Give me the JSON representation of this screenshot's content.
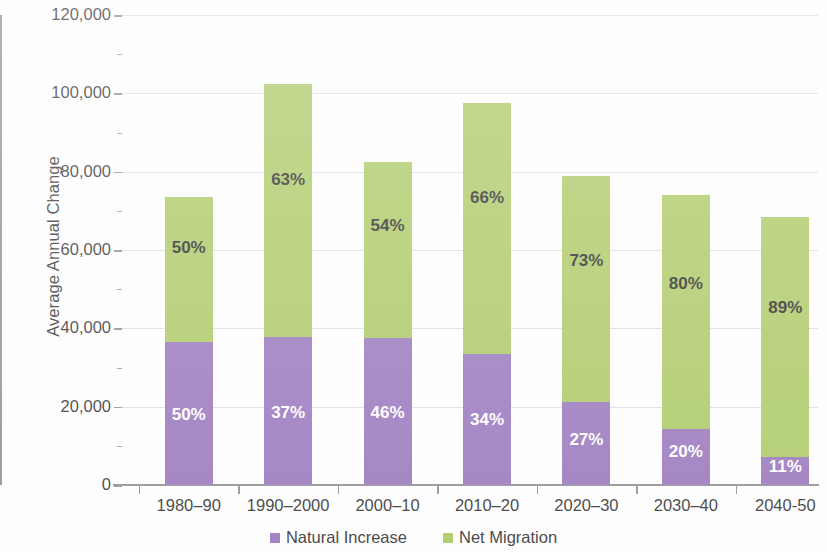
{
  "chart_data": {
    "type": "bar",
    "subtype": "stacked-bar",
    "title": "",
    "xlabel": "",
    "ylabel": "Average Annual Change",
    "ylim": [
      0,
      120000
    ],
    "ytick_values": [
      0,
      20000,
      40000,
      60000,
      80000,
      100000,
      120000
    ],
    "ytick_labels": [
      "0",
      "20,000",
      "40,000",
      "60,000",
      "80,000",
      "100,000",
      "120,000"
    ],
    "yminor_step": 10000,
    "grid": true,
    "grid_axis": "y",
    "legend_position": "bottom-center",
    "categories": [
      "1980–90",
      "1990–2000",
      "2000–10",
      "2010–20",
      "2020–30",
      "2030–40",
      "2040-50"
    ],
    "series": [
      {
        "name": "Natural Increase",
        "color": "#9470b9",
        "values": [
          36500,
          37700,
          37500,
          33500,
          21300,
          14200,
          7200
        ],
        "share_labels": [
          "50%",
          "37%",
          "46%",
          "34%",
          "27%",
          "20%",
          "11%"
        ],
        "label_color": "#ffffff"
      },
      {
        "name": "Net Migration",
        "color": "#a8c75c",
        "values": [
          37000,
          64800,
          45000,
          64000,
          57700,
          59800,
          61300
        ],
        "share_labels": [
          "50%",
          "63%",
          "54%",
          "66%",
          "73%",
          "80%",
          "89%"
        ],
        "label_color": "#231f20"
      }
    ],
    "totals": [
      73500,
      102500,
      82500,
      97500,
      79000,
      74000,
      68500
    ]
  },
  "legend": {
    "items": [
      {
        "label": "Natural Increase",
        "color": "#9470b9"
      },
      {
        "label": "Net Migration",
        "color": "#a8c75c"
      }
    ]
  },
  "axes": {
    "y_title": "Average Annual Change"
  }
}
